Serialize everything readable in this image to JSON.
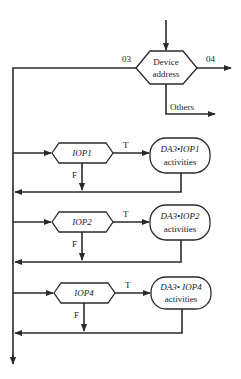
{
  "diagram": {
    "type": "flowchart",
    "decision_main": {
      "label_line1": "Device",
      "label_line2": "address",
      "branch_left": "03",
      "branch_right": "04",
      "branch_down": "Others"
    },
    "stages": [
      {
        "condition": "IOP1",
        "true_label": "T",
        "false_label": "F",
        "action_line1": "DA3•IOP1",
        "action_line2": "activities"
      },
      {
        "condition": "IOP2",
        "true_label": "T",
        "false_label": "F",
        "action_line1": "DA3•IOP2",
        "action_line2": "activities"
      },
      {
        "condition": "IOP4",
        "true_label": "T",
        "false_label": "F",
        "action_line1": "DA3• IOP4",
        "action_line2": "activities"
      }
    ],
    "colors": {
      "line": "#2a2a2a",
      "background": "#ffffff"
    }
  }
}
